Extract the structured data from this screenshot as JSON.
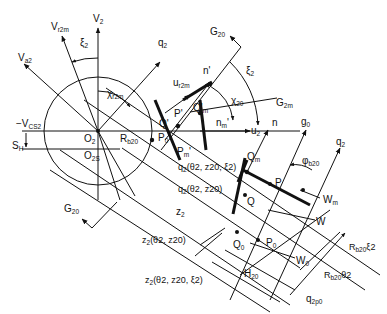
{
  "diagram": {
    "type": "technical-geometry",
    "labels": {
      "v2": "V",
      "v2_sub": "2",
      "vr2m": "V",
      "vr2m_sub": "r2m",
      "va2": "V",
      "va2_sub": "a2",
      "xi2_top": "ξ",
      "xi2_top_sub": "2",
      "chi_r2m": "χ",
      "chi_r2m_sub": "r2m",
      "q2_top": "q",
      "q2_top_sub": "2",
      "g20_top": "G",
      "g20_top_sub": "20",
      "n_prime": "n'",
      "xi2_right": "ξ",
      "xi2_right_sub": "2",
      "ur2m": "u",
      "ur2m_sub": "r2m",
      "chi20": "χ",
      "chi20_sub": "20",
      "g2m": "G",
      "g2m_sub": "2m",
      "p_prime": "P'",
      "qm_prime": "Q'",
      "qm_prime_sub": "m",
      "q_prime": "Q'",
      "nm_prime": "n",
      "nm_prime_sub": "m",
      "nm_prime_sup": "'",
      "u2": "u",
      "u2_sub": "2",
      "minus_vcs2": "−V",
      "minus_vcs2_sub": "CS2",
      "o2": "O",
      "o2_sub": "2",
      "rb20": "R",
      "rb20_sub": "b20",
      "sh": "S",
      "sh_sub": "H",
      "o2s": "O",
      "o2s_sub": "2S",
      "p0_left": "P",
      "p0_left_sub": "0",
      "pm_prime": "P",
      "pm_prime_sub": "m",
      "pm_prime_sup": "'",
      "n": "n",
      "g0": "g",
      "g0_sub": "0",
      "q2_right": "q",
      "q2_right_sub": "2",
      "phi_b20": "φ",
      "phi_b20_sub": "b20",
      "qm": "Q",
      "qm_sub": "m",
      "q2_theta_z20_xi2": "q",
      "q2_theta_z20_xi2_args": "(θ2, z20, ξ2)",
      "q2_theta_z20": "q",
      "q2_theta_z20_args": "(θ2, z20)",
      "p": "P",
      "wm": "W",
      "wm_sub": "m",
      "q": "Q",
      "w": "W",
      "z2": "z",
      "z2_sub": "2",
      "z2_theta_z20": "z",
      "z2_theta_z20_args": "(θ2, z20)",
      "q0": "Q",
      "q0_sub": "0",
      "p0": "P",
      "p0_sub": "0",
      "w0": "W",
      "w0_sub": "0",
      "g20_bottom": "G",
      "g20_bottom_sub": "20",
      "rb20_xi2": "R",
      "rb20_xi2_sub": "b20",
      "rb20_xi2_suffix": "ξ2",
      "h20": "H",
      "h20_sub": "20",
      "rb20_theta2": "R",
      "rb20_theta2_sub": "b20",
      "rb20_theta2_suffix": "θ2",
      "z2_theta_z20_xi2": "z",
      "z2_theta_z20_xi2_args": "(θ2, z20, ξ2)",
      "q2p0": "q",
      "q2p0_sub": "2p0"
    },
    "colors": {
      "stroke": "#111111",
      "background": "#ffffff"
    }
  }
}
